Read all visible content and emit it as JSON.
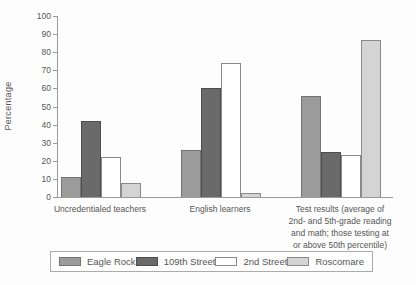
{
  "chart_data": {
    "type": "bar",
    "title": "",
    "xlabel": "",
    "ylabel": "Percentage",
    "ylim": [
      0,
      100
    ],
    "ytick_step": 10,
    "grid": false,
    "legend_position": "bottom",
    "categories": [
      "Uncredentialed teachers",
      "English learners",
      "Test results (average of 2nd- and 5th-grade reading and math; those testing at or above 50th percentile)"
    ],
    "category_lines": [
      [
        "Uncredentialed teachers"
      ],
      [
        "English learners"
      ],
      [
        "Test results (average of",
        "2nd- and 5th-grade reading",
        "and math; those testing at",
        "or above 50th percentile)"
      ]
    ],
    "series": [
      {
        "name": "Eagle Rock",
        "values": [
          11,
          26,
          56
        ],
        "fill": "#9b9b9b",
        "border": "#747474"
      },
      {
        "name": "109th Street",
        "values": [
          42,
          60,
          25
        ],
        "fill": "#6a6a6a",
        "border": "#4e4e4e"
      },
      {
        "name": "2nd Street",
        "values": [
          22,
          74,
          23
        ],
        "fill": "#ffffff",
        "border": "#8a8a8a"
      },
      {
        "name": "Roscomare",
        "values": [
          8,
          2,
          87
        ],
        "fill": "#d4d4d4",
        "border": "#8a8a8a"
      }
    ],
    "axis_color": "#9a9a9a",
    "text_color": "#565656"
  },
  "layout_hints": {
    "group_centers_px": [
      100,
      220,
      340
    ],
    "category_label_widths_px": [
      130,
      120,
      150
    ]
  }
}
